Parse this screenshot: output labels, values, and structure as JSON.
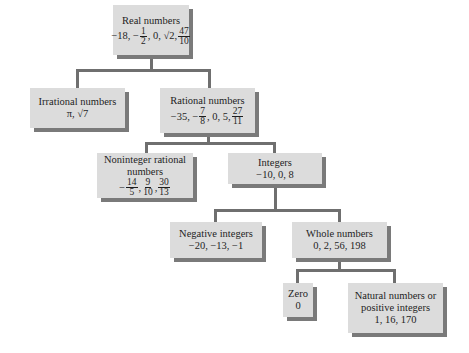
{
  "diagram": {
    "colors": {
      "box_fill": "#dcdcdc",
      "box_shadow": "#7a7a7a",
      "connector": "#6f6f6f",
      "text": "#1e1e1e"
    },
    "nodes": {
      "real": {
        "label": "Real numbers",
        "values": [
          {
            "t": "text",
            "v": "−18, −"
          },
          {
            "t": "frac",
            "num": "1",
            "den": "2"
          },
          {
            "t": "text",
            "v": ", 0, √2, "
          },
          {
            "t": "frac",
            "num": "47",
            "den": "10"
          }
        ]
      },
      "irrational": {
        "label": "Irrational numbers",
        "values_text": "π, √7"
      },
      "rational": {
        "label": "Rational numbers",
        "values": [
          {
            "t": "text",
            "v": "−35, −"
          },
          {
            "t": "frac",
            "num": "7",
            "den": "8"
          },
          {
            "t": "text",
            "v": ", 0, 5, "
          },
          {
            "t": "frac",
            "num": "27",
            "den": "11"
          }
        ]
      },
      "noninteger": {
        "label_line1": "Noninteger rational",
        "label_line2": "numbers",
        "values": [
          {
            "t": "text",
            "v": "−"
          },
          {
            "t": "frac",
            "num": "14",
            "den": "5"
          },
          {
            "t": "text",
            "v": ", "
          },
          {
            "t": "frac",
            "num": "9",
            "den": "10"
          },
          {
            "t": "text",
            "v": ", "
          },
          {
            "t": "frac",
            "num": "30",
            "den": "13"
          }
        ]
      },
      "integers": {
        "label": "Integers",
        "values_text": "−10, 0, 8"
      },
      "negative": {
        "label": "Negative integers",
        "values_text": "−20, −13, −1"
      },
      "whole": {
        "label": "Whole numbers",
        "values_text": "0, 2, 56, 198"
      },
      "zero": {
        "label": "Zero",
        "values_text": "0"
      },
      "natural": {
        "label_line1": "Natural numbers or",
        "label_line2": "positive integers",
        "values_text": "1, 16, 170"
      }
    },
    "edges": [
      [
        "real",
        "irrational"
      ],
      [
        "real",
        "rational"
      ],
      [
        "rational",
        "noninteger"
      ],
      [
        "rational",
        "integers"
      ],
      [
        "integers",
        "negative"
      ],
      [
        "integers",
        "whole"
      ],
      [
        "whole",
        "zero"
      ],
      [
        "whole",
        "natural"
      ]
    ]
  }
}
